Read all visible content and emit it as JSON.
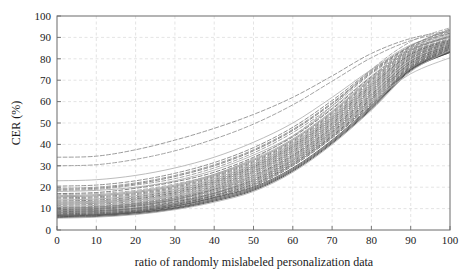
{
  "chart_data": {
    "type": "line",
    "title": "",
    "xlabel": "ratio of randomly mislabeled personalization data",
    "ylabel": "CER (%)",
    "xlim": [
      0,
      100
    ],
    "ylim": [
      0,
      100
    ],
    "xticks": [
      0,
      10,
      20,
      30,
      40,
      50,
      60,
      70,
      80,
      90,
      100
    ],
    "yticks": [
      0,
      10,
      20,
      30,
      40,
      50,
      60,
      70,
      80,
      90,
      100
    ],
    "xtick_labels": [
      "0",
      "10",
      "20",
      "30",
      "40",
      "50",
      "60",
      "70",
      "80",
      "90",
      "100"
    ],
    "ytick_labels": [
      "0",
      "10",
      "20",
      "30",
      "40",
      "50",
      "60",
      "70",
      "80",
      "90",
      "100"
    ],
    "grid": true,
    "grid_style": "dashed",
    "grid_color": "#d8d8d8",
    "legend": "none",
    "axis_color": "#6b6b6b",
    "background": "#ffffff",
    "x": [
      0,
      10,
      20,
      30,
      40,
      50,
      60,
      70,
      80,
      90,
      100
    ],
    "series": [
      {
        "name": "writer-01",
        "style": "dashed",
        "color": "#8a8a8a",
        "values": [
          34.0,
          34.5,
          37.5,
          42.0,
          47.5,
          54.0,
          62.0,
          72.0,
          82.5,
          89.5,
          93.0
        ]
      },
      {
        "name": "writer-02",
        "style": "dashed",
        "color": "#949494",
        "values": [
          30.0,
          30.5,
          33.0,
          37.0,
          42.5,
          49.5,
          58.5,
          69.5,
          80.5,
          88.5,
          92.5
        ]
      },
      {
        "name": "writer-03",
        "style": "solid",
        "color": "#b0b0b0",
        "values": [
          23.0,
          23.5,
          25.5,
          29.0,
          34.0,
          41.0,
          50.0,
          62.0,
          75.0,
          86.5,
          92.0
        ]
      },
      {
        "name": "writer-04",
        "style": "dashed",
        "color": "#7e7e7e",
        "values": [
          20.5,
          21.0,
          23.0,
          26.5,
          31.5,
          38.5,
          48.0,
          60.5,
          74.5,
          86.0,
          93.5
        ]
      },
      {
        "name": "writer-05",
        "style": "dashed",
        "color": "#888888",
        "values": [
          19.5,
          20.0,
          22.0,
          25.5,
          30.5,
          37.5,
          47.0,
          59.5,
          74.0,
          86.0,
          94.0
        ]
      },
      {
        "name": "writer-06",
        "style": "dashed",
        "color": "#727272",
        "values": [
          19.0,
          19.5,
          21.5,
          25.0,
          30.0,
          37.0,
          46.5,
          59.0,
          73.5,
          85.5,
          92.0
        ]
      },
      {
        "name": "writer-07",
        "style": "dashed",
        "color": "#909090",
        "values": [
          18.5,
          19.0,
          21.0,
          24.0,
          29.0,
          36.0,
          45.5,
          58.0,
          73.0,
          85.0,
          93.0
        ]
      },
      {
        "name": "writer-08",
        "style": "solid",
        "color": "#a8a8a8",
        "values": [
          18.0,
          18.5,
          20.0,
          23.0,
          28.0,
          35.0,
          44.0,
          57.0,
          72.0,
          85.0,
          91.5
        ]
      },
      {
        "name": "writer-09",
        "style": "dashed",
        "color": "#6a6a6a",
        "values": [
          17.0,
          17.5,
          19.5,
          22.5,
          27.0,
          34.0,
          43.5,
          56.5,
          71.5,
          84.5,
          90.5
        ]
      },
      {
        "name": "writer-10",
        "style": "solid",
        "color": "#9c9c9c",
        "values": [
          16.0,
          16.5,
          18.0,
          21.0,
          26.0,
          33.0,
          42.5,
          55.5,
          71.0,
          84.0,
          91.0
        ]
      },
      {
        "name": "writer-11",
        "style": "solid",
        "color": "#8e8e8e",
        "values": [
          15.5,
          16.0,
          17.5,
          20.5,
          25.5,
          32.5,
          42.0,
          55.0,
          70.5,
          84.0,
          90.0
        ]
      },
      {
        "name": "writer-12",
        "style": "dashed",
        "color": "#7a7a7a",
        "values": [
          15.0,
          15.5,
          17.0,
          20.0,
          25.0,
          32.0,
          41.5,
          54.5,
          70.0,
          83.5,
          90.5
        ]
      },
      {
        "name": "writer-13",
        "style": "dashed",
        "color": "#848484",
        "values": [
          14.5,
          15.0,
          16.5,
          19.5,
          24.5,
          31.5,
          41.0,
          54.0,
          69.5,
          83.0,
          89.5
        ]
      },
      {
        "name": "writer-14",
        "style": "solid",
        "color": "#a0a0a0",
        "values": [
          14.0,
          14.5,
          16.0,
          19.0,
          24.0,
          31.0,
          40.5,
          53.5,
          69.0,
          83.0,
          89.0
        ]
      },
      {
        "name": "writer-15",
        "style": "dashed",
        "color": "#6e6e6e",
        "values": [
          13.5,
          14.0,
          15.5,
          18.5,
          23.5,
          30.5,
          40.0,
          53.0,
          68.5,
          82.5,
          89.0
        ]
      },
      {
        "name": "writer-16",
        "style": "solid",
        "color": "#949494",
        "values": [
          13.0,
          13.5,
          15.0,
          18.0,
          23.0,
          30.0,
          39.5,
          52.5,
          68.0,
          82.0,
          88.5
        ]
      },
      {
        "name": "writer-17",
        "style": "dashed",
        "color": "#606060",
        "values": [
          12.5,
          13.0,
          14.5,
          17.5,
          22.5,
          29.5,
          39.0,
          52.0,
          67.5,
          82.0,
          88.5
        ]
      },
      {
        "name": "writer-18",
        "style": "solid",
        "color": "#8a8a8a",
        "values": [
          12.0,
          12.5,
          14.0,
          17.0,
          22.0,
          29.0,
          38.5,
          51.5,
          67.0,
          81.5,
          88.0
        ]
      },
      {
        "name": "writer-19",
        "style": "dashed",
        "color": "#787878",
        "values": [
          11.5,
          12.0,
          13.5,
          16.5,
          21.5,
          28.5,
          38.0,
          51.0,
          66.5,
          81.0,
          88.0
        ]
      },
      {
        "name": "writer-20",
        "style": "solid",
        "color": "#9a9a9a",
        "values": [
          11.0,
          11.5,
          13.0,
          16.0,
          21.0,
          28.0,
          37.5,
          50.5,
          66.0,
          81.0,
          87.5
        ]
      },
      {
        "name": "writer-21",
        "style": "dashed",
        "color": "#666666",
        "values": [
          10.5,
          11.0,
          12.5,
          15.5,
          20.5,
          27.5,
          37.0,
          50.0,
          65.5,
          80.5,
          87.5
        ]
      },
      {
        "name": "writer-22",
        "style": "solid",
        "color": "#8c8c8c",
        "values": [
          10.2,
          10.7,
          12.2,
          15.0,
          20.0,
          27.0,
          36.5,
          49.5,
          65.0,
          80.0,
          87.0
        ]
      },
      {
        "name": "writer-23",
        "style": "dashed",
        "color": "#747474",
        "values": [
          10.0,
          10.5,
          12.0,
          14.8,
          19.5,
          26.5,
          36.0,
          49.0,
          64.5,
          80.0,
          87.0
        ]
      },
      {
        "name": "writer-24",
        "style": "solid",
        "color": "#a4a4a4",
        "values": [
          9.8,
          10.2,
          11.8,
          14.5,
          19.2,
          26.0,
          35.5,
          48.5,
          64.0,
          79.5,
          86.5
        ]
      },
      {
        "name": "writer-25",
        "style": "dashed",
        "color": "#5c5c5c",
        "values": [
          9.5,
          10.0,
          11.5,
          14.2,
          19.0,
          25.5,
          35.0,
          48.0,
          63.5,
          79.0,
          86.5
        ]
      },
      {
        "name": "writer-26",
        "style": "solid",
        "color": "#828282",
        "values": [
          9.2,
          9.7,
          11.2,
          14.0,
          18.5,
          25.0,
          34.5,
          47.5,
          63.0,
          79.0,
          86.0
        ]
      },
      {
        "name": "writer-27",
        "style": "dashed",
        "color": "#707070",
        "values": [
          9.0,
          9.5,
          11.0,
          13.5,
          18.0,
          24.5,
          34.0,
          47.0,
          62.5,
          78.5,
          86.0
        ]
      },
      {
        "name": "writer-28",
        "style": "solid",
        "color": "#969696",
        "values": [
          8.8,
          9.2,
          10.5,
          13.2,
          17.5,
          24.0,
          33.5,
          46.5,
          62.0,
          78.0,
          85.5
        ]
      },
      {
        "name": "writer-29",
        "style": "dashed",
        "color": "#585858",
        "values": [
          8.5,
          9.0,
          10.2,
          13.0,
          17.2,
          23.5,
          33.0,
          46.0,
          61.5,
          78.0,
          85.5
        ]
      },
      {
        "name": "writer-30",
        "style": "solid",
        "color": "#7c7c7c",
        "values": [
          8.2,
          8.7,
          10.0,
          12.5,
          17.0,
          23.0,
          32.5,
          45.5,
          61.0,
          77.5,
          85.0
        ]
      },
      {
        "name": "writer-31",
        "style": "dashed",
        "color": "#686868",
        "values": [
          8.0,
          8.5,
          9.8,
          12.2,
          16.5,
          22.5,
          32.0,
          45.0,
          60.5,
          77.0,
          85.0
        ]
      },
      {
        "name": "writer-32",
        "style": "solid",
        "color": "#8e8e8e",
        "values": [
          7.8,
          8.2,
          9.5,
          12.0,
          16.2,
          22.0,
          31.5,
          44.5,
          60.0,
          77.0,
          84.5
        ]
      },
      {
        "name": "writer-33",
        "style": "dashed",
        "color": "#545454",
        "values": [
          7.5,
          8.0,
          9.2,
          11.8,
          16.0,
          21.5,
          31.0,
          44.0,
          59.5,
          76.5,
          84.5
        ]
      },
      {
        "name": "writer-34",
        "style": "solid",
        "color": "#787878",
        "values": [
          7.2,
          7.7,
          9.0,
          11.5,
          15.5,
          21.0,
          30.5,
          43.5,
          59.0,
          76.0,
          84.0
        ]
      },
      {
        "name": "writer-35",
        "style": "dashed",
        "color": "#646464",
        "values": [
          7.0,
          7.5,
          8.8,
          11.2,
          15.2,
          20.5,
          30.0,
          43.0,
          58.5,
          76.0,
          84.0
        ]
      },
      {
        "name": "writer-36",
        "style": "solid",
        "color": "#4e4e4e",
        "values": [
          6.8,
          7.2,
          8.5,
          11.0,
          15.0,
          20.0,
          29.0,
          42.0,
          58.0,
          75.5,
          83.5
        ]
      },
      {
        "name": "writer-37",
        "style": "solid",
        "color": "#5a5a5a",
        "values": [
          6.5,
          7.0,
          8.2,
          10.5,
          14.5,
          19.5,
          28.5,
          41.5,
          57.5,
          75.0,
          83.5
        ]
      },
      {
        "name": "writer-38",
        "style": "solid",
        "color": "#464646",
        "values": [
          6.2,
          6.7,
          8.0,
          10.2,
          14.0,
          19.0,
          28.0,
          41.0,
          57.0,
          75.0,
          83.0
        ]
      },
      {
        "name": "writer-39",
        "style": "solid",
        "color": "#3e3e3e",
        "values": [
          5.8,
          6.3,
          7.5,
          9.8,
          13.5,
          18.5,
          27.5,
          40.5,
          56.5,
          74.5,
          83.0
        ]
      },
      {
        "name": "writer-40",
        "style": "solid",
        "color": "#aeaeae",
        "values": [
          5.5,
          6.0,
          7.2,
          9.5,
          13.0,
          18.0,
          27.0,
          40.0,
          56.0,
          74.0,
          84.0
        ]
      },
      {
        "name": "writer-41",
        "style": "solid",
        "color": "#b6b6b6",
        "values": [
          12.5,
          13.0,
          14.0,
          16.0,
          19.5,
          25.0,
          33.0,
          45.0,
          60.0,
          73.0,
          80.5
        ]
      },
      {
        "name": "writer-42",
        "style": "dashed",
        "color": "#9e9e9e",
        "values": [
          16.5,
          17.0,
          18.5,
          21.5,
          26.0,
          33.5,
          44.0,
          58.0,
          75.0,
          88.0,
          94.5
        ]
      }
    ]
  }
}
